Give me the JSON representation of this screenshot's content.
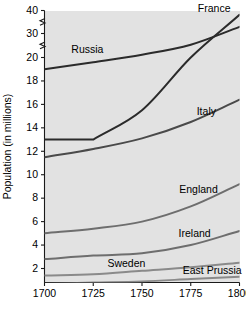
{
  "chart_data": {
    "type": "line",
    "title": "",
    "xlabel": "",
    "ylabel": "Population (in millions)",
    "x": [
      1700,
      1725,
      1750,
      1775,
      1800
    ],
    "xlim": [
      1700,
      1800
    ],
    "xticks": [
      1700,
      1725,
      1750,
      1775,
      1800
    ],
    "xticklabels": [
      "1700",
      "1725",
      "1750",
      "1775",
      "1800"
    ],
    "ylim": [
      0.4,
      20.6
    ],
    "yticks": [
      2,
      4,
      6,
      8,
      10,
      12,
      14,
      16,
      18,
      20
    ],
    "yticklabels": [
      "2",
      "4",
      "6",
      "8",
      "10",
      "12",
      "14",
      "16",
      "18",
      "20"
    ],
    "y_broken_ticks": [
      30,
      40
    ],
    "y_broken_ticklabels": [
      "30",
      "40"
    ],
    "axis_break": true,
    "grid": false,
    "legend": "inline-labels",
    "series": [
      {
        "name": "Russia",
        "label": "Russia",
        "color": "#2b2b2b",
        "width": 2.0,
        "values": [
          19.0,
          19.6,
          20.4,
          21.8,
          24.3
        ],
        "label_x": 1722,
        "label_y": 20.6
      },
      {
        "name": "France",
        "label": "France",
        "color": "#2b2b2b",
        "width": 2.0,
        "values": [
          13.0,
          13.0,
          15.5,
          20.0,
          26.0
        ],
        "label_x": 1787,
        "label_y": 26.4
      },
      {
        "name": "Italy",
        "label": "Italy",
        "color": "#4a4a4a",
        "width": 2.0,
        "values": [
          11.5,
          12.2,
          13.1,
          14.5,
          16.4
        ],
        "label_x": 1783,
        "label_y": 15.1
      },
      {
        "name": "England",
        "label": "England",
        "color": "#6e6e6e",
        "width": 2.0,
        "values": [
          5.0,
          5.4,
          6.0,
          7.3,
          9.2
        ],
        "label_x": 1779,
        "label_y": 8.4
      },
      {
        "name": "Ireland",
        "label": "Ireland",
        "color": "#6e6e6e",
        "width": 2.0,
        "values": [
          2.8,
          3.1,
          3.3,
          4.0,
          5.2
        ],
        "label_x": 1777,
        "label_y": 4.7
      },
      {
        "name": "Sweden",
        "label": "Sweden",
        "color": "#8a8a8a",
        "width": 2.0,
        "values": [
          1.4,
          1.5,
          1.8,
          2.1,
          2.5
        ],
        "label_x": 1742,
        "label_y": 2.1
      },
      {
        "name": "East Prussia",
        "label": "East Prussia",
        "color": "#8a8a8a",
        "width": 2.0,
        "values": [
          0.7,
          0.8,
          0.9,
          1.1,
          1.3
        ],
        "label_x": 1786,
        "label_y": 1.5
      }
    ]
  }
}
